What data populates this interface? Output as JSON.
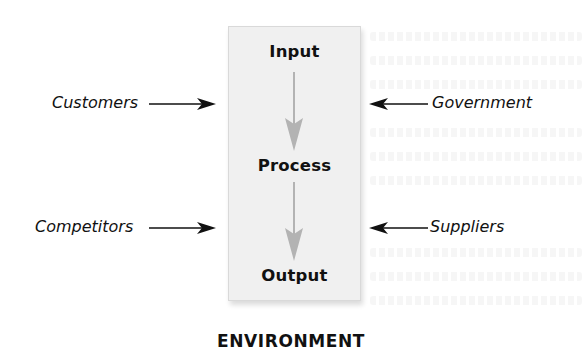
{
  "diagram": {
    "type": "systems-model",
    "container_label": "ENVIRONMENT",
    "stages": [
      {
        "id": "input",
        "label": "Input"
      },
      {
        "id": "process",
        "label": "Process"
      },
      {
        "id": "output",
        "label": "Output"
      }
    ],
    "flows": [
      {
        "from": "input",
        "to": "process"
      },
      {
        "from": "process",
        "to": "output"
      }
    ],
    "external_influences": {
      "left": [
        {
          "label": "Customers",
          "direction": "into-system"
        },
        {
          "label": "Competitors",
          "direction": "into-system"
        }
      ],
      "right": [
        {
          "label": "Government",
          "direction": "into-system"
        },
        {
          "label": "Suppliers",
          "direction": "into-system"
        }
      ]
    },
    "colors": {
      "box_fill": "#f0f0f0",
      "box_border": "#d9d9d9",
      "flow_arrow": "#b3b3b3",
      "text": "#111111",
      "influence_arrow": "#111111"
    }
  }
}
